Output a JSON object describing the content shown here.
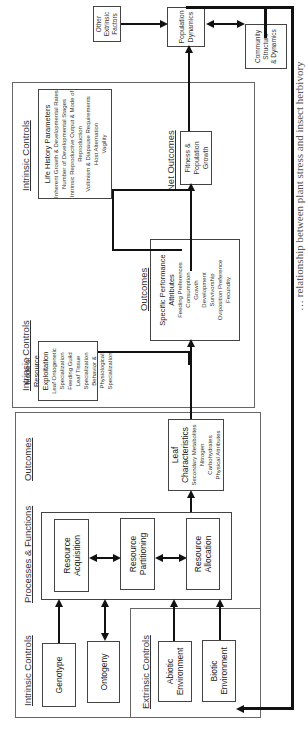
{
  "headers": {
    "intrinsic_controls_1": "Intrinsic Controls",
    "extrinsic_controls": "Extrinsic Controls",
    "processes_functions": "Processes & Functions",
    "outcomes_1": "Outcomes",
    "intrinsic_controls_2": "Intrinsic Controls",
    "outcomes_2": "Outcomes",
    "intrinsic_controls_3": "Intrinsic Controls",
    "net_outcomes": "Net Outcomes"
  },
  "boxes": {
    "genotype": "Genotype",
    "ontogeny": "Ontogeny",
    "abiotic": [
      "Abiotic",
      "Environment"
    ],
    "biotic": [
      "Biotic",
      "Environment"
    ],
    "resource_acquisition": [
      "Resource",
      "Acquisition"
    ],
    "resource_partitioning": [
      "Resource",
      "Partitioning"
    ],
    "resource_allocation": [
      "Resource",
      "Allocation"
    ],
    "leaf_characteristics": {
      "title": [
        "Leaf",
        "Characteristics"
      ],
      "items": [
        "Secondary Metabolites",
        "Nitrogen",
        "Carbohydrates",
        "Physical Attributes"
      ]
    },
    "mode_of_resource": {
      "title": [
        "Mode of Resource",
        "Exploitation"
      ],
      "items": [
        "Leaf Ontogenetic Specialization",
        "Feeding Guild",
        "Leaf Tissue Specialization",
        "Behavior & Physiological Specialization"
      ]
    },
    "specific_performance": {
      "title": [
        "Specific Performance",
        "Attributes"
      ],
      "items": [
        "Feeding Preferences",
        "Consumption",
        "Growth",
        "Development",
        "Survivorship",
        "Oviposition Preference",
        "Fecundity"
      ]
    },
    "life_history": {
      "title": "Life History Parameters",
      "items": [
        "Inherent Growth & Developmental Rates",
        "Number of Developmental Stages",
        "Intrinsic Reproductive Output & Mode of Reproduction",
        "Voltinism & Diapause Requirements",
        "Host Alternation",
        "Vagility"
      ]
    },
    "fitness": [
      "Fitness &",
      "Population Growth"
    ],
    "population_dynamics": [
      "Population",
      "Dynamics"
    ],
    "other_extrinsic": [
      "Other",
      "Extrinsic",
      "Factors"
    ],
    "community": [
      "Community",
      "Structure",
      "& Dynamics"
    ]
  },
  "caption": "… relationship between plant stress and insect herbivory"
}
